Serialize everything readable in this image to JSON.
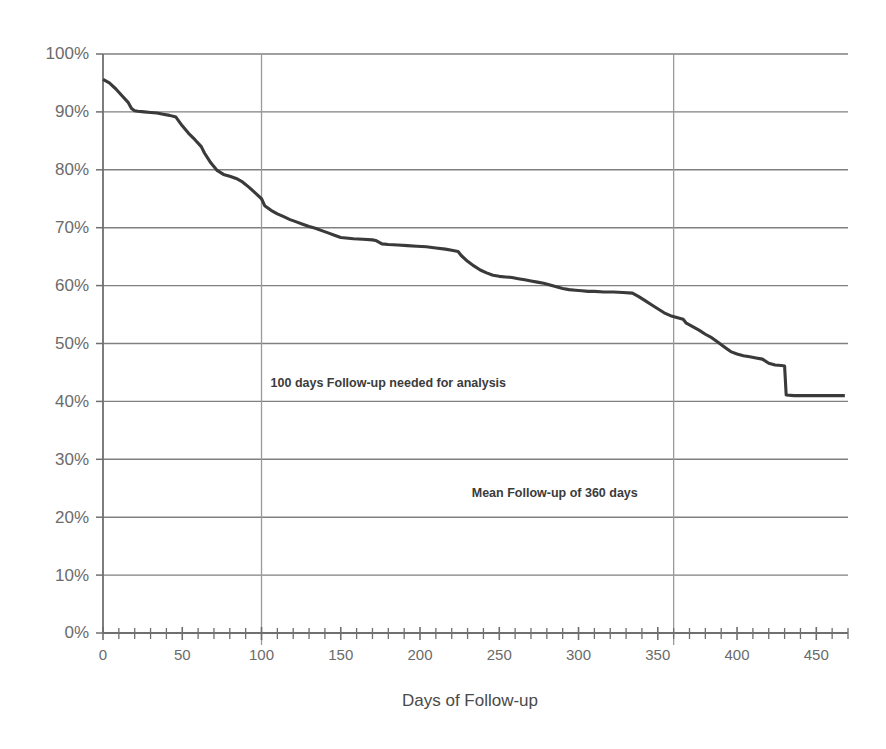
{
  "chart_data": {
    "type": "line",
    "title": "",
    "xlabel": "Days of Follow-up",
    "ylabel": "",
    "xlim": [
      0,
      470
    ],
    "ylim": [
      0,
      100
    ],
    "grid": true,
    "legend_position": "none",
    "x_tick_labels": [
      "0",
      "50",
      "100",
      "150",
      "200",
      "250",
      "300",
      "350",
      "400",
      "450"
    ],
    "x_tick_values": [
      0,
      50,
      100,
      150,
      200,
      250,
      300,
      350,
      400,
      450
    ],
    "x_minor_tick_step": 10,
    "y_tick_labels": [
      "0%",
      "10%",
      "20%",
      "30%",
      "40%",
      "50%",
      "60%",
      "70%",
      "80%",
      "90%",
      "100%"
    ],
    "y_tick_values": [
      0,
      10,
      20,
      30,
      40,
      50,
      60,
      70,
      80,
      90,
      100
    ],
    "vertical_reference_lines": [
      100,
      360
    ],
    "series": [
      {
        "name": "Proportion still in follow-up",
        "x": [
          0,
          4,
          8,
          12,
          16,
          18,
          20,
          22,
          26,
          30,
          34,
          38,
          42,
          46,
          50,
          54,
          58,
          62,
          64,
          68,
          72,
          76,
          80,
          84,
          88,
          92,
          96,
          100,
          102,
          106,
          110,
          114,
          118,
          122,
          126,
          130,
          134,
          138,
          142,
          146,
          150,
          158,
          164,
          170,
          172,
          176,
          180,
          186,
          192,
          198,
          204,
          210,
          216,
          220,
          224,
          226,
          230,
          234,
          238,
          242,
          246,
          250,
          254,
          258,
          262,
          266,
          270,
          274,
          278,
          282,
          286,
          290,
          294,
          298,
          302,
          306,
          310,
          316,
          322,
          328,
          334,
          338,
          342,
          346,
          350,
          354,
          358,
          362,
          366,
          368,
          372,
          376,
          380,
          384,
          388,
          392,
          396,
          400,
          404,
          408,
          412,
          416,
          420,
          424,
          428,
          430,
          431,
          436,
          444,
          452,
          460,
          468
        ],
        "y": [
          95.6,
          95.0,
          94.0,
          92.8,
          91.6,
          90.6,
          90.2,
          90.1,
          90.0,
          89.9,
          89.8,
          89.6,
          89.4,
          89.1,
          87.6,
          86.3,
          85.2,
          84.0,
          82.9,
          81.2,
          79.9,
          79.2,
          78.9,
          78.5,
          77.9,
          77.0,
          76.0,
          75.0,
          73.8,
          73.0,
          72.4,
          71.9,
          71.4,
          71.0,
          70.6,
          70.2,
          69.9,
          69.5,
          69.1,
          68.7,
          68.3,
          68.1,
          68.0,
          67.9,
          67.8,
          67.2,
          67.1,
          67.0,
          66.9,
          66.8,
          66.7,
          66.5,
          66.3,
          66.1,
          65.9,
          65.2,
          64.2,
          63.4,
          62.7,
          62.2,
          61.8,
          61.6,
          61.5,
          61.4,
          61.2,
          61.0,
          60.8,
          60.6,
          60.4,
          60.1,
          59.8,
          59.5,
          59.3,
          59.2,
          59.1,
          59.0,
          59.0,
          58.9,
          58.9,
          58.8,
          58.7,
          58.1,
          57.4,
          56.7,
          56.0,
          55.3,
          54.8,
          54.5,
          54.2,
          53.5,
          52.9,
          52.3,
          51.6,
          51.0,
          50.2,
          49.4,
          48.6,
          48.2,
          47.9,
          47.7,
          47.5,
          47.3,
          46.6,
          46.3,
          46.2,
          46.1,
          41.1,
          41.0,
          41.0,
          41.0,
          41.0,
          41.0
        ]
      }
    ],
    "annotations": [
      {
        "id": "followup-needed-note",
        "text": "100 days Follow-up needed for analysis",
        "x": 180,
        "y": 42.5
      },
      {
        "id": "mean-followup-note",
        "text": "Mean Follow-up of 360 days",
        "x": 285,
        "y": 23.5
      }
    ]
  }
}
